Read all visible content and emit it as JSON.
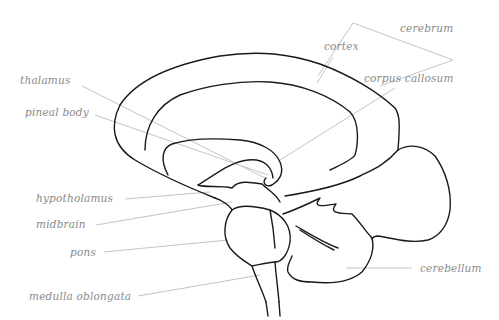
{
  "diagram": {
    "colors": {
      "outline": "#1a1a1a",
      "label_text": "#8a8a8a",
      "leader_line": "#c4c4c4",
      "background": "#ffffff"
    },
    "labels": [
      {
        "id": "cerebrum",
        "text": "cerebrum"
      },
      {
        "id": "cortex",
        "text": "cortex"
      },
      {
        "id": "corpus_callosum",
        "text": "corpus callosum"
      },
      {
        "id": "thalamus",
        "text": "thalamus"
      },
      {
        "id": "pineal_body",
        "text": "pineal body"
      },
      {
        "id": "hypotholamus",
        "text": "hypotholamus"
      },
      {
        "id": "midbrain",
        "text": "midbrain"
      },
      {
        "id": "pons",
        "text": "pons"
      },
      {
        "id": "medulla_oblongata",
        "text": "medulla oblongata"
      },
      {
        "id": "cerebellum",
        "text": "cerebellum"
      }
    ]
  }
}
